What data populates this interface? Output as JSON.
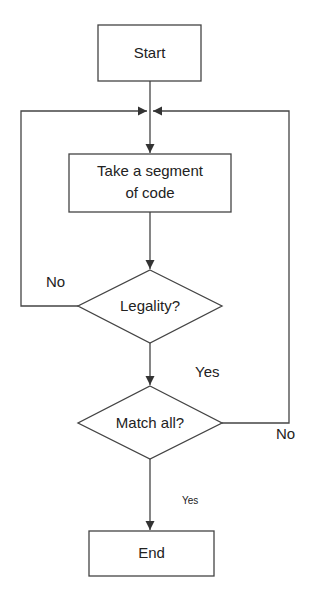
{
  "diagram": {
    "type": "flowchart",
    "nodes": {
      "start": {
        "label": "Start",
        "shape": "rectangle"
      },
      "take_segment": {
        "label_line1": "Take a segment",
        "label_line2": "of code",
        "shape": "rectangle"
      },
      "legality": {
        "label": "Legality?",
        "shape": "diamond"
      },
      "match_all": {
        "label": "Match all?",
        "shape": "diamond"
      },
      "end": {
        "label": "End",
        "shape": "rectangle"
      }
    },
    "edges": {
      "legality_no": {
        "label": "No",
        "from": "legality",
        "to": "take_segment"
      },
      "legality_yes": {
        "label": "Yes",
        "from": "legality",
        "to": "match_all"
      },
      "match_no": {
        "label": "No",
        "from": "match_all",
        "to": "take_segment"
      },
      "match_yes": {
        "label": "Yes",
        "from": "match_all",
        "to": "end"
      }
    },
    "colors": {
      "stroke": "#333333",
      "background": "#ffffff"
    }
  }
}
